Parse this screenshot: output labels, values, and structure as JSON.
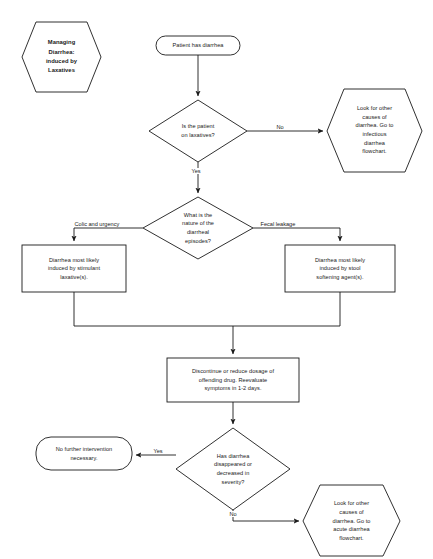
{
  "diagram": {
    "title": "Managing Diarrhea: induced by Laxatives",
    "background_color": "#ffffff",
    "line_color": "#1a1a1a",
    "text_color": "#1a1a1a"
  },
  "nodes": {
    "title_hexagon": {
      "label": "Managing\nDiarrhea:\ninduced by\nLaxatives",
      "shape": "hexagon"
    },
    "start": {
      "label": "Patient has diarrhea",
      "shape": "rounded-rectangle"
    },
    "decision_on_laxatives": {
      "label": "Is the patient\non laxatives?",
      "shape": "diamond"
    },
    "infectious_referral": {
      "label": "Look for other\ncauses of\ndiarrhea. Go to\ninfectious\ndiarrhea\nflowchart.",
      "shape": "hexagon"
    },
    "decision_nature": {
      "label": "What is the\nnature of the\ndiarrheal\nepisodes?",
      "shape": "diamond"
    },
    "stimulant_box": {
      "label": "Diarrhea most likely\ninduced by stimulant\nlaxative(s).",
      "shape": "rectangle"
    },
    "stool_softener_box": {
      "label": "Diarrhea most likely\ninduced by stool\nsoftening agent(s).",
      "shape": "rectangle"
    },
    "discontinue_box": {
      "label": "Discontinue or reduce dosage of\noffending drug. Reevaluate\nsymptoms in 1-2 days.",
      "shape": "rectangle"
    },
    "decision_improved": {
      "label": "Has diarrhea\ndisappeared or\ndecreased in\nseverity?",
      "shape": "diamond"
    },
    "no_intervention": {
      "label": "No further intervention\nnecessary.",
      "shape": "rounded-rectangle"
    },
    "acute_referral": {
      "label": "Look for other\ncauses of\ndiarrhea. Go to\nacute diarrhea\nflowchart.",
      "shape": "hexagon"
    }
  },
  "edge_labels": {
    "laxatives_no": "No",
    "laxatives_yes": "Yes",
    "nature_colic": "Colic and urgency",
    "nature_fecal": "Fecal leakage",
    "improved_yes": "Yes",
    "improved_no": "No"
  }
}
